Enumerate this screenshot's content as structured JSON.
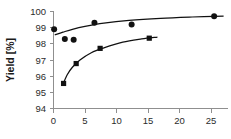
{
  "chart_data": {
    "type": "scatter",
    "title": "",
    "xlabel": "",
    "ylabel": "Yield [%]",
    "xlim": [
      0,
      28
    ],
    "ylim": [
      94,
      100
    ],
    "grid": false,
    "legend": "none",
    "xticks": [
      "0",
      "5",
      "10",
      "15",
      "20",
      "25"
    ],
    "xtick_values": [
      0,
      5,
      10,
      15,
      20,
      25
    ],
    "yticks": [
      "94",
      "95",
      "96",
      "97",
      "98",
      "99",
      "100"
    ],
    "ytick_values": [
      94,
      95,
      96,
      97,
      98,
      99,
      100
    ],
    "series": [
      {
        "name": "upper-series",
        "marker": "circle",
        "x": [
          0.1,
          1.8,
          3.2,
          6.5,
          12.4,
          25.5
        ],
        "y": [
          98.9,
          98.3,
          98.25,
          99.3,
          99.2,
          99.7
        ],
        "trend_x": [
          0.2,
          1.5,
          3.0,
          5.0,
          8.0,
          12.0,
          17.0,
          22.0,
          27.0
        ],
        "trend_y": [
          98.55,
          98.72,
          98.9,
          99.08,
          99.28,
          99.45,
          99.58,
          99.66,
          99.72
        ]
      },
      {
        "name": "lower-series",
        "marker": "square",
        "x": [
          1.6,
          3.6,
          7.4,
          15.2
        ],
        "y": [
          95.55,
          96.78,
          97.72,
          98.35
        ],
        "trend_x": [
          1.5,
          2.2,
          3.0,
          4.2,
          6.0,
          8.0,
          11.0,
          14.0,
          16.5
        ],
        "trend_y": [
          95.5,
          96.1,
          96.55,
          97.0,
          97.45,
          97.75,
          98.1,
          98.3,
          98.42
        ]
      }
    ]
  },
  "axes": {
    "y_axis_title": "Yield [%]"
  }
}
